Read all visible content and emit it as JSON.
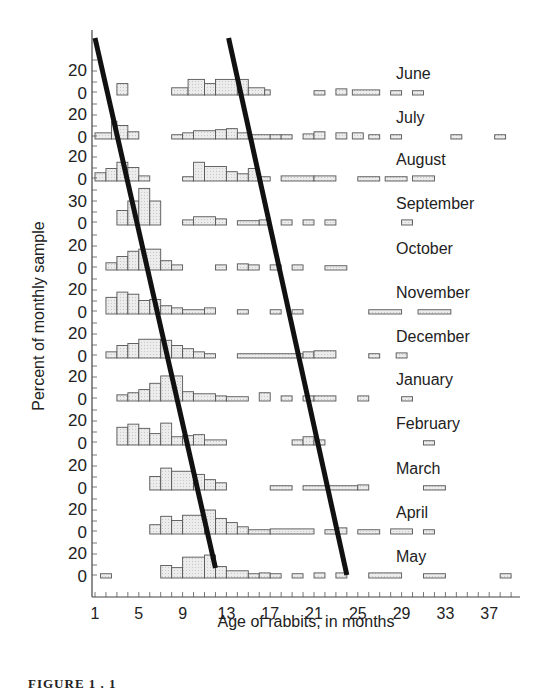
{
  "chart_data": {
    "type": "bar",
    "subtype": "stacked-monthly-histograms",
    "title": "",
    "xlabel": "Age of rabbits, in months",
    "ylabel": "Percent of monthly sample",
    "x_ticks": [
      1,
      5,
      9,
      13,
      17,
      21,
      25,
      29,
      33,
      37
    ],
    "xlim": [
      1,
      40
    ],
    "y_tick_labels_per_row": [
      "20",
      "0"
    ],
    "y_tick_label_september": "30",
    "grid": false,
    "legend": null,
    "rows": [
      {
        "month": "June",
        "baseline": 92,
        "bins": [
          [
            3,
            4,
            8
          ],
          [
            8,
            9.5,
            4
          ],
          [
            9.5,
            11,
            12
          ],
          [
            11,
            12,
            8
          ],
          [
            12,
            14,
            12
          ],
          [
            14,
            15,
            12
          ],
          [
            15,
            16.5,
            4
          ],
          [
            16.5,
            17,
            2
          ],
          [
            21,
            22,
            1
          ],
          [
            23,
            24,
            3
          ],
          [
            24.5,
            27,
            2
          ],
          [
            28,
            29,
            1
          ],
          [
            30,
            31,
            1
          ]
        ]
      },
      {
        "month": "July",
        "baseline": 136,
        "bins": [
          [
            1,
            2.5,
            3
          ],
          [
            2.5,
            3,
            14
          ],
          [
            3,
            4,
            10
          ],
          [
            4,
            5,
            4
          ],
          [
            8,
            9,
            1
          ],
          [
            9,
            10,
            3
          ],
          [
            10,
            12,
            5
          ],
          [
            12,
            13,
            6
          ],
          [
            13,
            14,
            7
          ],
          [
            14,
            15,
            3
          ],
          [
            15,
            17,
            1
          ],
          [
            17,
            18,
            1
          ],
          [
            18,
            19,
            1
          ],
          [
            20,
            21,
            2
          ],
          [
            21,
            22,
            4
          ],
          [
            23,
            24,
            3
          ],
          [
            24.5,
            25.5,
            3
          ],
          [
            26,
            27,
            1
          ],
          [
            28,
            29,
            1
          ],
          [
            33.5,
            34.5,
            1
          ],
          [
            37.5,
            38.5,
            1
          ]
        ]
      },
      {
        "month": "August",
        "baseline": 178,
        "bins": [
          [
            1,
            2,
            5
          ],
          [
            2,
            3,
            9
          ],
          [
            3,
            4,
            15
          ],
          [
            4,
            5,
            10
          ],
          [
            5,
            6,
            2
          ],
          [
            9,
            10,
            1
          ],
          [
            10,
            11,
            15
          ],
          [
            11,
            13,
            11
          ],
          [
            13,
            14,
            6
          ],
          [
            14,
            15,
            4
          ],
          [
            15,
            16,
            9
          ],
          [
            16,
            17,
            1
          ],
          [
            18,
            21,
            2
          ],
          [
            21,
            23,
            2
          ],
          [
            25,
            27,
            1
          ],
          [
            27.5,
            29.5,
            1
          ],
          [
            30,
            32,
            2
          ]
        ]
      },
      {
        "month": "September",
        "baseline": 222,
        "bins": [
          [
            3,
            4,
            11
          ],
          [
            4,
            5,
            20
          ],
          [
            5,
            6,
            32
          ],
          [
            6,
            7,
            20
          ],
          [
            9,
            10,
            2
          ],
          [
            10,
            12,
            5
          ],
          [
            12,
            13,
            3
          ],
          [
            14,
            16,
            1
          ],
          [
            16,
            17,
            2
          ],
          [
            18,
            19,
            2
          ],
          [
            20,
            21,
            2
          ],
          [
            22,
            23,
            2
          ],
          [
            29,
            30,
            2
          ]
        ]
      },
      {
        "month": "October",
        "baseline": 267,
        "bins": [
          [
            2,
            3,
            4
          ],
          [
            3,
            4,
            10
          ],
          [
            4,
            5,
            15
          ],
          [
            5,
            7,
            17
          ],
          [
            7,
            8,
            6
          ],
          [
            8,
            9,
            2
          ],
          [
            12,
            13,
            2
          ],
          [
            14,
            15,
            3
          ],
          [
            15,
            16,
            2
          ],
          [
            17,
            18,
            2
          ],
          [
            19,
            20,
            2
          ],
          [
            22,
            24,
            1
          ]
        ]
      },
      {
        "month": "November",
        "baseline": 311,
        "bins": [
          [
            2,
            3,
            13
          ],
          [
            3,
            4,
            18
          ],
          [
            4,
            5,
            16
          ],
          [
            5,
            6,
            10
          ],
          [
            6,
            7,
            11
          ],
          [
            7,
            8,
            5
          ],
          [
            8,
            9,
            3
          ],
          [
            9,
            11,
            1
          ],
          [
            11,
            12,
            3
          ],
          [
            14,
            15,
            1
          ],
          [
            17,
            18,
            1
          ],
          [
            19,
            20,
            1
          ],
          [
            26,
            29,
            1
          ],
          [
            30.5,
            33.5,
            1
          ]
        ]
      },
      {
        "month": "December",
        "baseline": 355,
        "bins": [
          [
            2,
            3,
            3
          ],
          [
            3,
            4,
            9
          ],
          [
            4,
            5,
            11
          ],
          [
            5,
            7,
            15
          ],
          [
            7,
            8,
            14
          ],
          [
            8,
            9,
            9
          ],
          [
            9,
            10,
            6
          ],
          [
            10,
            11,
            3
          ],
          [
            11,
            12,
            1
          ],
          [
            14,
            20,
            1
          ],
          [
            20,
            21,
            3
          ],
          [
            21,
            23,
            4
          ],
          [
            26,
            27,
            1
          ],
          [
            28.5,
            29.5,
            2
          ]
        ]
      },
      {
        "month": "January",
        "baseline": 398,
        "bins": [
          [
            3,
            4,
            3
          ],
          [
            4,
            5,
            5
          ],
          [
            5,
            6,
            8
          ],
          [
            6,
            7,
            14
          ],
          [
            7,
            9,
            21
          ],
          [
            9,
            10,
            6
          ],
          [
            10,
            12,
            4
          ],
          [
            12,
            13,
            2
          ],
          [
            13,
            15,
            1
          ],
          [
            16,
            17,
            5
          ],
          [
            18,
            19,
            2
          ],
          [
            20,
            21,
            2
          ],
          [
            21,
            23,
            2
          ],
          [
            25,
            26,
            2
          ],
          [
            29,
            30,
            1
          ]
        ]
      },
      {
        "month": "February",
        "baseline": 442,
        "bins": [
          [
            3,
            4,
            14
          ],
          [
            4,
            5,
            17
          ],
          [
            5,
            6,
            13
          ],
          [
            6,
            7,
            8
          ],
          [
            7,
            8,
            18
          ],
          [
            8,
            9,
            5
          ],
          [
            9,
            10,
            6
          ],
          [
            10,
            11,
            7
          ],
          [
            11,
            13,
            2
          ],
          [
            19,
            20,
            2
          ],
          [
            20,
            21,
            5
          ],
          [
            21,
            22,
            2
          ],
          [
            31,
            32,
            1
          ]
        ]
      },
      {
        "month": "March",
        "baseline": 487,
        "bins": [
          [
            6,
            7,
            10
          ],
          [
            7,
            8,
            18
          ],
          [
            8,
            10,
            15
          ],
          [
            10,
            11,
            12
          ],
          [
            11,
            12,
            7
          ],
          [
            12,
            13,
            4
          ],
          [
            17,
            19,
            1
          ],
          [
            20,
            25,
            1
          ],
          [
            25,
            26,
            2
          ],
          [
            31,
            33,
            1
          ]
        ]
      },
      {
        "month": "April",
        "baseline": 531,
        "bins": [
          [
            6,
            7,
            6
          ],
          [
            7,
            8,
            14
          ],
          [
            8,
            9,
            10
          ],
          [
            9,
            11,
            15
          ],
          [
            11,
            12,
            20
          ],
          [
            12,
            13,
            12
          ],
          [
            13,
            14,
            8
          ],
          [
            14,
            15,
            4
          ],
          [
            15,
            17,
            1
          ],
          [
            17,
            21,
            2
          ],
          [
            22,
            23,
            1
          ],
          [
            23,
            24,
            3
          ],
          [
            25,
            27,
            1
          ],
          [
            28,
            30,
            2
          ],
          [
            31,
            32,
            1
          ]
        ]
      },
      {
        "month": "May",
        "baseline": 575,
        "bins": [
          [
            1.5,
            2.5,
            1
          ],
          [
            7,
            8,
            9
          ],
          [
            8,
            9,
            7
          ],
          [
            9,
            11,
            17
          ],
          [
            11,
            12,
            19
          ],
          [
            12,
            13,
            8
          ],
          [
            13,
            15,
            4
          ],
          [
            15,
            16,
            1
          ],
          [
            16,
            17,
            2
          ],
          [
            17,
            18,
            1
          ],
          [
            19,
            20,
            1
          ],
          [
            21,
            22,
            2
          ],
          [
            23,
            24,
            2
          ],
          [
            26,
            29,
            2
          ],
          [
            31,
            33,
            1
          ],
          [
            38,
            39,
            1
          ]
        ]
      }
    ],
    "trend_lines": [
      {
        "name": "cohort-line-1",
        "from": [
          1,
          38
        ],
        "to": [
          12,
          568
        ]
      },
      {
        "name": "cohort-line-2",
        "from": [
          13.2,
          38
        ],
        "to": [
          24,
          575
        ]
      }
    ]
  },
  "figure": {
    "caption": "FIGURE 1 . 1"
  }
}
